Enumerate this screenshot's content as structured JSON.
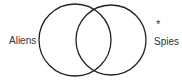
{
  "diagram": {
    "type": "venn",
    "sets": [
      {
        "id": "left",
        "label": "Aliens",
        "cx": 75,
        "cy": 40,
        "r": 36
      },
      {
        "id": "right",
        "label": "Spies",
        "cx": 111,
        "cy": 40,
        "r": 35
      }
    ],
    "marker": {
      "symbol": "*",
      "position": "outside right set, above label"
    },
    "stroke_color": "#222222",
    "text_color": "#333333"
  }
}
